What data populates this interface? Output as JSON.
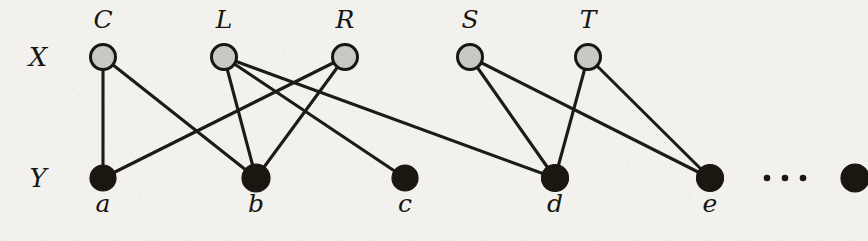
{
  "figure": {
    "background_color": "#f2f1ee",
    "edge_color": "#1c1b19",
    "top_node_fill": "#c9c8c5",
    "top_node_stroke": "#17160f",
    "bottom_node_fill": "#19170f"
  },
  "row_labels": {
    "top": "X",
    "bottom": "Y"
  },
  "chart_data": {
    "type": "diagram",
    "subtype": "bipartite-graph",
    "title": "",
    "top_set_label": "X",
    "bottom_set_label": "Y",
    "top_nodes": [
      {
        "id": "C",
        "label": "C",
        "x": 103,
        "y": 57,
        "r": 12.5,
        "label_x": 103,
        "label_y": 28
      },
      {
        "id": "L",
        "label": "L",
        "x": 224,
        "y": 57,
        "r": 12.5,
        "label_x": 224,
        "label_y": 28
      },
      {
        "id": "R",
        "label": "R",
        "x": 345,
        "y": 57,
        "r": 12.5,
        "label_x": 345,
        "label_y": 28
      },
      {
        "id": "S",
        "label": "S",
        "x": 470,
        "y": 57,
        "r": 12.5,
        "label_x": 470,
        "label_y": 28
      },
      {
        "id": "T",
        "label": "T",
        "x": 588,
        "y": 57,
        "r": 12.5,
        "label_x": 588,
        "label_y": 28
      }
    ],
    "bottom_nodes": [
      {
        "id": "a",
        "label": "a",
        "x": 103,
        "y": 178,
        "r": 13.0,
        "label_x": 103,
        "label_y": 212
      },
      {
        "id": "b",
        "label": "b",
        "x": 256,
        "y": 178,
        "r": 14.0,
        "label_x": 256,
        "label_y": 212
      },
      {
        "id": "c",
        "label": "c",
        "x": 405,
        "y": 178,
        "r": 13.0,
        "label_x": 405,
        "label_y": 212
      },
      {
        "id": "d",
        "label": "d",
        "x": 555,
        "y": 178,
        "r": 13.5,
        "label_x": 555,
        "label_y": 212
      },
      {
        "id": "e",
        "label": "e",
        "x": 710,
        "y": 178,
        "r": 13.5,
        "label_x": 710,
        "label_y": 212
      },
      {
        "id": "z",
        "label": "",
        "x": 855,
        "y": 178,
        "r": 14.0,
        "label_x": 855,
        "label_y": 212
      }
    ],
    "edges": [
      {
        "from": "C",
        "to": "a"
      },
      {
        "from": "C",
        "to": "b"
      },
      {
        "from": "L",
        "to": "b"
      },
      {
        "from": "L",
        "to": "c"
      },
      {
        "from": "L",
        "to": "d"
      },
      {
        "from": "R",
        "to": "a"
      },
      {
        "from": "R",
        "to": "b"
      },
      {
        "from": "S",
        "to": "d"
      },
      {
        "from": "S",
        "to": "e"
      },
      {
        "from": "T",
        "to": "d"
      },
      {
        "from": "T",
        "to": "e"
      }
    ],
    "ellipsis": {
      "text": "...",
      "x": 785,
      "y": 178,
      "dots": 3
    }
  }
}
